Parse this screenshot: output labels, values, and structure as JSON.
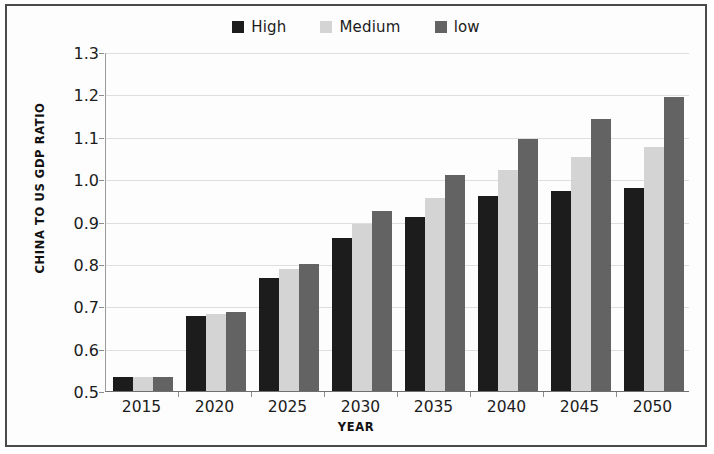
{
  "chart_data": {
    "type": "bar",
    "title": "",
    "xlabel": "YEAR",
    "ylabel": "CHINA TO US GDP RATIO",
    "categories": [
      "2015",
      "2020",
      "2025",
      "2030",
      "2035",
      "2040",
      "2045",
      "2050"
    ],
    "series": [
      {
        "name": "High",
        "color": "#1c1c1c",
        "values": [
          0.533,
          0.678,
          0.767,
          0.86,
          0.91,
          0.96,
          0.973,
          0.978
        ]
      },
      {
        "name": "Medium",
        "color": "#d4d4d4",
        "values": [
          0.533,
          0.681,
          0.787,
          0.893,
          0.955,
          1.021,
          1.053,
          1.077
        ]
      },
      {
        "name": "low",
        "color": "#636363",
        "values": [
          0.533,
          0.686,
          0.8,
          0.925,
          1.01,
          1.095,
          1.143,
          1.195
        ]
      }
    ],
    "ylim": [
      0.5,
      1.3
    ],
    "ytick_step": 0.1,
    "yticks": [
      "1.3",
      "1.2",
      "1.1",
      "1.0",
      "0.9",
      "0.8",
      "0.7",
      "0.6",
      "0.5"
    ],
    "grid": true,
    "legend_position": "top-center"
  },
  "legend": {
    "items": [
      {
        "label": "High",
        "color": "#1c1c1c"
      },
      {
        "label": "Medium",
        "color": "#d4d4d4"
      },
      {
        "label": "low",
        "color": "#636363"
      }
    ]
  },
  "axes": {
    "y_title": "CHINA TO US GDP RATIO",
    "x_title": "YEAR"
  }
}
